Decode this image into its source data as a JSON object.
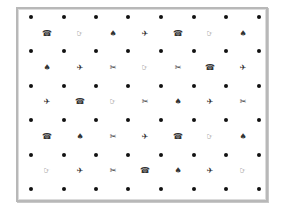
{
  "grid": {
    "dot_rows_y": [
      17,
      51,
      86,
      120,
      155,
      189
    ],
    "dot_cols_x": [
      31,
      64,
      96,
      128,
      161,
      194,
      226,
      259
    ],
    "symbol_rows_y": [
      34,
      68,
      102,
      137,
      171
    ],
    "symbol_cols_x": [
      47,
      80,
      113,
      145,
      178,
      210,
      243
    ],
    "symbols": {
      "telephone": "☎",
      "pointing-hand": "☞",
      "spade": "♠",
      "airplane": "✈",
      "scissors": "✂"
    },
    "rows": [
      [
        "telephone",
        "pointing-hand",
        "spade",
        "airplane",
        "telephone",
        "pointing-hand",
        "spade"
      ],
      [
        "spade",
        "airplane",
        "scissors",
        "pointing-hand",
        "scissors",
        "telephone",
        "airplane"
      ],
      [
        "airplane",
        "telephone",
        "pointing-hand",
        "scissors",
        "spade",
        "airplane",
        "scissors"
      ],
      [
        "telephone",
        "spade",
        "scissors",
        "airplane",
        "telephone",
        "pointing-hand",
        "spade"
      ],
      [
        "pointing-hand",
        "airplane",
        "scissors",
        "telephone",
        "spade",
        "airplane",
        "pointing-hand"
      ]
    ]
  }
}
